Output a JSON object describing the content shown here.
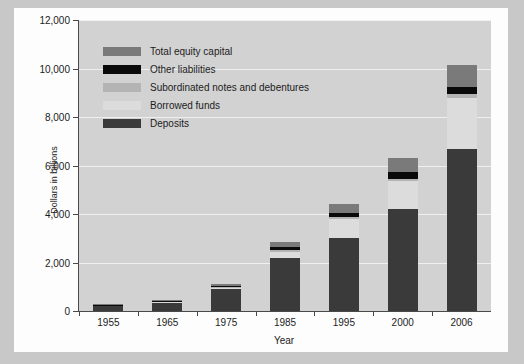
{
  "chart_data": {
    "type": "bar",
    "subtype": "stacked-vertical",
    "title": "",
    "xlabel": "Year",
    "ylabel": "Dollars in billions",
    "categories": [
      "1955",
      "1965",
      "1975",
      "1985",
      "1995",
      "2000",
      "2006"
    ],
    "ylim": [
      0,
      12000
    ],
    "yticks": [
      0,
      2000,
      4000,
      6000,
      8000,
      10000,
      12000
    ],
    "ytick_labels": [
      "0",
      "2,000",
      "4,000",
      "6,000",
      "8,000",
      "10,000",
      "12,000"
    ],
    "grid": true,
    "grid_axis": "y",
    "legend_position": "upper-left-inside",
    "series": [
      {
        "name": "Deposits",
        "color": "#3a3a3a",
        "values": [
          200,
          350,
          900,
          2200,
          3000,
          4200,
          6700
        ]
      },
      {
        "name": "Borrowed funds",
        "color": "#dcdcdc",
        "values": [
          10,
          20,
          60,
          250,
          800,
          1150,
          2100
        ]
      },
      {
        "name": "Subordinated notes and debentures",
        "color": "#b4b4b4",
        "values": [
          5,
          10,
          20,
          50,
          80,
          100,
          150
        ]
      },
      {
        "name": "Other liabilities",
        "color": "#0a0a0a",
        "values": [
          15,
          20,
          60,
          160,
          180,
          300,
          300
        ]
      },
      {
        "name": "Total equity capital",
        "color": "#7a7a7a",
        "values": [
          20,
          30,
          80,
          180,
          350,
          550,
          900
        ]
      }
    ],
    "totals": [
      250,
      430,
      1120,
      2840,
      4410,
      6300,
      10150
    ]
  },
  "legend": {
    "items": [
      {
        "label": "Total equity capital",
        "color": "#7a7a7a"
      },
      {
        "label": "Other liabilities",
        "color": "#0a0a0a"
      },
      {
        "label": "Subordinated notes and debentures",
        "color": "#b4b4b4"
      },
      {
        "label": "Borrowed funds",
        "color": "#dcdcdc"
      },
      {
        "label": "Deposits",
        "color": "#3a3a3a"
      }
    ]
  },
  "colors": {
    "figure_background": "#fdfdfd",
    "plot_background": "#d2d2d2",
    "page_background": "#c8c8c8",
    "axis": "#4a4a4a",
    "gridline": "#efefef",
    "text": "#1c1c1c"
  }
}
